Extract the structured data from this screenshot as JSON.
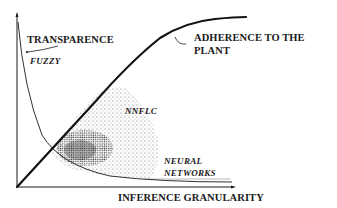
{
  "diagram": {
    "axes": {
      "x_label": "INFERENCE GRANULARITY",
      "y_label": ""
    },
    "curves": {
      "transparence": {
        "label": "TRANSPARENCE",
        "sublabel": "FUZZY",
        "style": "thin decreasing curve"
      },
      "adherence": {
        "label_line1": "ADHERENCE TO THE",
        "label_line2": "PLANT",
        "style": "thick increasing sigmoid curve"
      },
      "neural": {
        "label_line1": "NEURAL",
        "label_line2": "NETWORKS"
      }
    },
    "region": {
      "label": "NNFLC",
      "style": "stippled dotted area between curves"
    },
    "colors": {
      "ink": "#1a1a1a",
      "background": "#ffffff",
      "stipple": "#333333"
    }
  }
}
